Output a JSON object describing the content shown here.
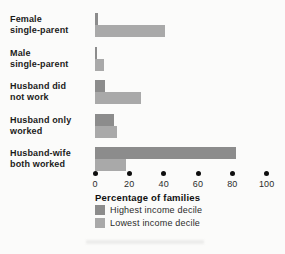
{
  "chart_data": {
    "type": "bar",
    "orientation": "horizontal",
    "title": "",
    "xlabel": "Percentage of families",
    "ylabel": "",
    "xlim": [
      0,
      100
    ],
    "xticks": [
      0,
      20,
      40,
      60,
      80,
      100
    ],
    "grid": false,
    "legend_position": "bottom-left",
    "categories": [
      "Female single-parent",
      "Male single-parent",
      "Husband did not work",
      "Husband only worked",
      "Husband-wife both worked"
    ],
    "category_lines": [
      [
        "Female",
        "single-parent"
      ],
      [
        "Male",
        "single-parent"
      ],
      [
        "Husband did",
        "not work"
      ],
      [
        "Husband only",
        "worked"
      ],
      [
        "Husband-wife",
        "both worked"
      ]
    ],
    "series": [
      {
        "name": "Highest income decile",
        "color": "#8c8c8c",
        "values": [
          2,
          1,
          6,
          11,
          82
        ]
      },
      {
        "name": "Lowest income decile",
        "color": "#a9a9a9",
        "values": [
          41,
          5,
          27,
          13,
          18
        ]
      }
    ]
  },
  "colors": {
    "background": "#fbfbfa",
    "text": "#1b1b1b",
    "tick_dot": "#0e0e0e",
    "highest_decile_bar": "#8c8c8c",
    "lowest_decile_bar": "#a9a9a9"
  }
}
